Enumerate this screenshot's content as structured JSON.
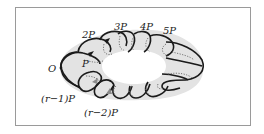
{
  "figure": {
    "labels": {
      "origin": "O",
      "p1": "P",
      "p2": "2P",
      "p3": "3P",
      "p4": "4P",
      "p5": "5P",
      "pr1": "(r−1)P",
      "pr2": "(r−2)P"
    },
    "colors": {
      "torus_fill": "#e3e3e3",
      "stroke": "#1a1a1a",
      "dotted": "#6a6a6a",
      "frame": "#9a9a9a"
    }
  }
}
